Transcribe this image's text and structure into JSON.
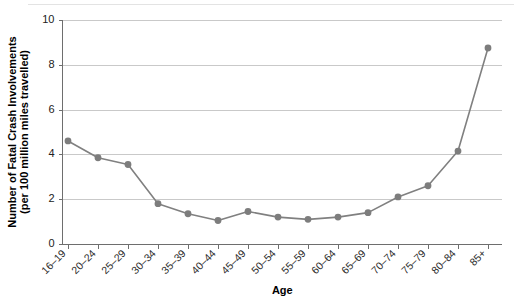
{
  "chart_data": {
    "type": "line",
    "title": "",
    "xlabel": "Age",
    "ylabel": "Number of Fatal Crash Involvements (per 100 million miles travelled)",
    "ylabel_line1": "Number of Fatal Crash Involvements",
    "ylabel_line2": "(per 100 million miles travelled)",
    "categories": [
      "16–19",
      "20–24",
      "25–29",
      "30–34",
      "35–39",
      "40–44",
      "45–49",
      "50–54",
      "55–59",
      "60–64",
      "65–69",
      "70–74",
      "75–79",
      "80–84",
      "85+"
    ],
    "values": [
      4.6,
      3.85,
      3.55,
      1.8,
      1.35,
      1.05,
      1.45,
      1.2,
      1.1,
      1.2,
      1.4,
      2.1,
      2.6,
      4.15,
      8.75
    ],
    "ylim": [
      0,
      10
    ],
    "yticks": [
      0,
      2,
      4,
      6,
      8,
      10
    ],
    "ytick_labels": [
      "0",
      "2",
      "4",
      "6",
      "8",
      "10"
    ],
    "grid": true,
    "grid_axis": "y",
    "legend": false,
    "marker": "circle",
    "series_color": "#808080",
    "grid_color": "#c9c9c9",
    "axis_color": "#6e6e6e",
    "background": "#ffffff"
  }
}
